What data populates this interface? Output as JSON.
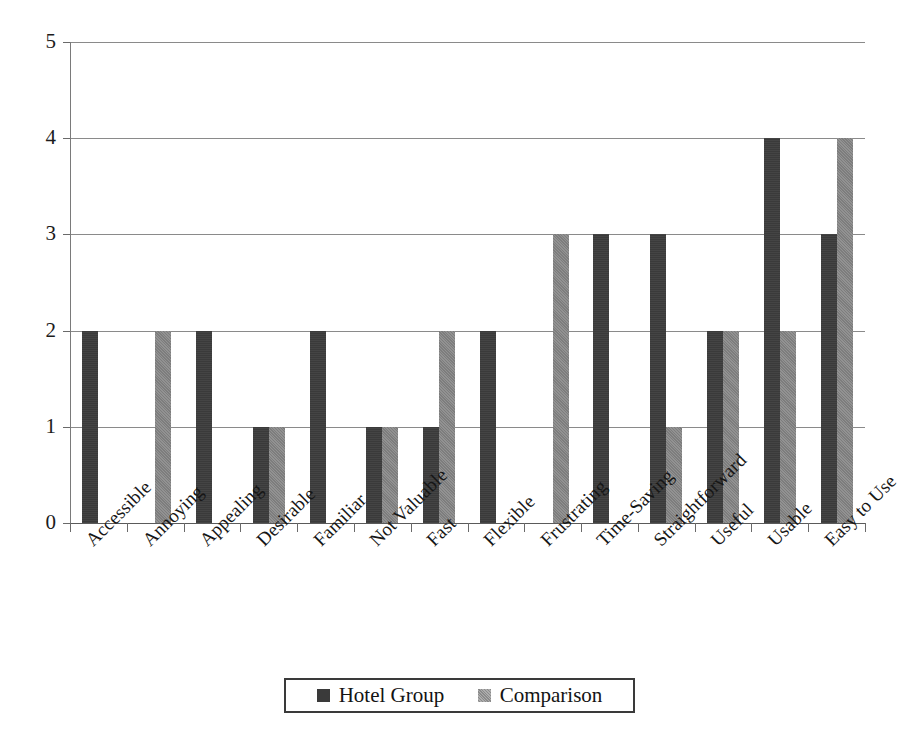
{
  "chart_data": {
    "type": "bar",
    "title": "",
    "subtitle": "",
    "xlabel": "",
    "ylabel": "",
    "ylim": [
      0,
      5
    ],
    "yticks": [
      0,
      1,
      2,
      3,
      4,
      5
    ],
    "ytick_labels": [
      "0",
      "1",
      "2",
      "3",
      "4",
      "5"
    ],
    "grid": true,
    "grid_axis": "y",
    "legend_position": "bottom-center",
    "orientation": "vertical",
    "categories": [
      "Accessible",
      "Annoying",
      "Appealing",
      "Desirable",
      "Familiar",
      "Not Valuable",
      "Fast",
      "Flexible",
      "Frustrating",
      "Time-Saving",
      "Straightforward",
      "Useful",
      "Usable",
      "Easy to Use"
    ],
    "series": [
      {
        "name": "Hotel Group",
        "color": "#3a3a3a",
        "values": [
          2,
          0,
          2,
          1,
          2,
          1,
          1,
          2,
          0,
          3,
          3,
          2,
          4,
          3
        ]
      },
      {
        "name": "Comparison",
        "color": "#7d7d7d",
        "values": [
          0,
          2,
          0,
          1,
          0,
          1,
          2,
          0,
          3,
          0,
          1,
          2,
          2,
          4
        ]
      }
    ]
  },
  "legend": {
    "entries": [
      {
        "label": "Hotel Group",
        "swatch": "hotel-group-swatch"
      },
      {
        "label": "Comparison",
        "swatch": "comparison-swatch"
      }
    ]
  },
  "axes": {
    "y_tick_labels": [
      "5",
      "4",
      "3",
      "2",
      "1",
      "0"
    ]
  }
}
